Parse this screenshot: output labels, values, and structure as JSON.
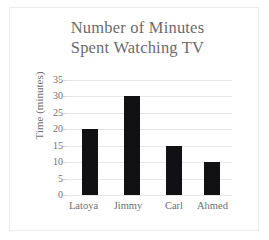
{
  "chart_data": {
    "type": "bar",
    "title": "Number of Minutes Spent Watching TV",
    "title_lines": [
      "Number of Minutes",
      "Spent Watching TV"
    ],
    "categories": [
      "Latoya",
      "Jimmy",
      "Carl",
      "Ahmed"
    ],
    "values": [
      20,
      30,
      15,
      10
    ],
    "xlabel": "",
    "ylabel": "Time (minutes)",
    "ylim": [
      0,
      35
    ],
    "ytick_labels": [
      "35",
      "30",
      "25",
      "20",
      "15",
      "10",
      "5",
      "0"
    ],
    "ytick_values": [
      35,
      30,
      25,
      20,
      15,
      10,
      5,
      0
    ],
    "grid": true,
    "legend": false,
    "colors": {
      "bar": "#111114",
      "gridline": "#e7e7e8",
      "title_text": "#6b6b6e",
      "tick_text": "#6f6f72",
      "background": "#ffffff",
      "frame_border": "#ececed"
    }
  }
}
